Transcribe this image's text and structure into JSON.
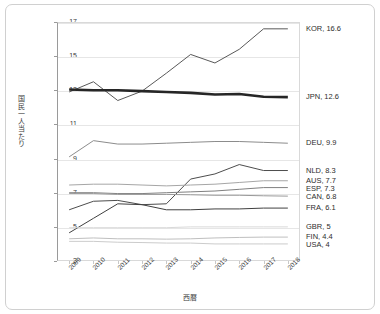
{
  "chart_data": {
    "type": "line",
    "title": "",
    "xlabel": "西暦",
    "ylabel": "国民一人当たり",
    "x": [
      "2009",
      "2010",
      "2011",
      "2012",
      "2013",
      "2014",
      "2015",
      "2016",
      "2017",
      "2018"
    ],
    "ylim": [
      3,
      17
    ],
    "yticks": [
      3,
      5,
      7,
      9,
      11,
      13,
      15,
      17
    ],
    "grid": true,
    "legend_position": "right",
    "series": [
      {
        "name": "KOR",
        "label": "KOR, 16.6",
        "end_value": 16.6,
        "color": "#595959",
        "width": 1.0,
        "values": [
          12.9,
          13.5,
          12.4,
          12.95,
          14.0,
          15.1,
          14.6,
          15.4,
          16.6,
          16.6
        ]
      },
      {
        "name": "JPN",
        "label": "JPN, 12.6",
        "end_value": 12.6,
        "color": "#262626",
        "width": 2.6,
        "values": [
          13.05,
          13.0,
          13.0,
          12.95,
          12.9,
          12.85,
          12.75,
          12.78,
          12.62,
          12.6
        ]
      },
      {
        "name": "DEU",
        "label": "DEU, 9.9",
        "end_value": 9.9,
        "color": "#8c8c8c",
        "width": 1.0,
        "values": [
          9.1,
          10.05,
          9.85,
          9.85,
          9.9,
          9.95,
          10.0,
          10.0,
          9.95,
          9.9
        ]
      },
      {
        "name": "NLD",
        "label": "NLD, 8.3",
        "end_value": 8.3,
        "color": "#4d4d4d",
        "width": 1.0,
        "values": [
          6.0,
          6.5,
          6.55,
          6.3,
          6.35,
          7.8,
          8.1,
          8.65,
          8.3,
          8.3
        ]
      },
      {
        "name": "AUS",
        "label": "AUS, 7.7",
        "end_value": 7.7,
        "color": "#a6a6a6",
        "width": 1.0,
        "values": [
          7.45,
          7.5,
          7.5,
          7.45,
          7.4,
          7.45,
          7.5,
          7.6,
          7.7,
          7.7
        ]
      },
      {
        "name": "ESP",
        "label": "ESP, 7.3",
        "end_value": 7.3,
        "color": "#808080",
        "width": 1.0,
        "values": [
          7.0,
          7.0,
          6.95,
          6.95,
          7.0,
          7.05,
          7.1,
          7.2,
          7.3,
          7.3
        ]
      },
      {
        "name": "CAN",
        "label": "CAN, 6.8",
        "end_value": 6.8,
        "color": "#999999",
        "width": 1.0,
        "values": [
          6.95,
          6.95,
          6.9,
          6.9,
          6.9,
          6.88,
          6.85,
          6.85,
          6.82,
          6.8
        ]
      },
      {
        "name": "FRA",
        "label": "FRA, 6.1",
        "end_value": 6.1,
        "color": "#404040",
        "width": 1.0,
        "values": [
          4.65,
          5.5,
          6.35,
          6.3,
          6.0,
          6.0,
          6.05,
          6.05,
          6.1,
          6.1
        ]
      },
      {
        "name": "GBR",
        "label": "GBR, 5",
        "end_value": 5,
        "color": "#d9d9d9",
        "width": 1.0,
        "values": [
          4.95,
          4.95,
          4.95,
          4.95,
          4.95,
          5.0,
          5.0,
          5.0,
          5.0,
          5.0
        ]
      },
      {
        "name": "FIN",
        "label": "FIN, 4.4",
        "end_value": 4.4,
        "color": "#bfbfbf",
        "width": 1.0,
        "values": [
          4.3,
          4.35,
          4.3,
          4.3,
          4.28,
          4.3,
          4.35,
          4.38,
          4.4,
          4.4
        ]
      },
      {
        "name": "USA",
        "label": "USA, 4",
        "end_value": 4,
        "color": "#cccccc",
        "width": 1.0,
        "values": [
          4.15,
          4.15,
          4.1,
          4.08,
          4.05,
          4.05,
          4.0,
          4.0,
          4.0,
          4.0
        ]
      }
    ]
  }
}
